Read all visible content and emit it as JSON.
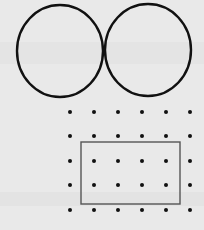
{
  "figure": {
    "background": "#e9e9e9",
    "stroke_color": "#111111",
    "rect_stroke_color": "#555555",
    "dot_color": "#111111",
    "circles": [
      {
        "name": "left-circle",
        "cx": 60,
        "cy": 51,
        "rx": 43,
        "ry": 46
      },
      {
        "name": "right-circle",
        "cx": 148,
        "cy": 50,
        "rx": 43,
        "ry": 46
      }
    ],
    "dot_grid": {
      "columns_x": [
        70,
        94,
        118,
        142,
        166,
        190
      ],
      "rows_y": [
        112,
        136,
        161,
        185,
        210
      ],
      "radius": 2
    },
    "rectangle": {
      "x": 81,
      "y": 142,
      "width": 99,
      "height": 62
    }
  }
}
